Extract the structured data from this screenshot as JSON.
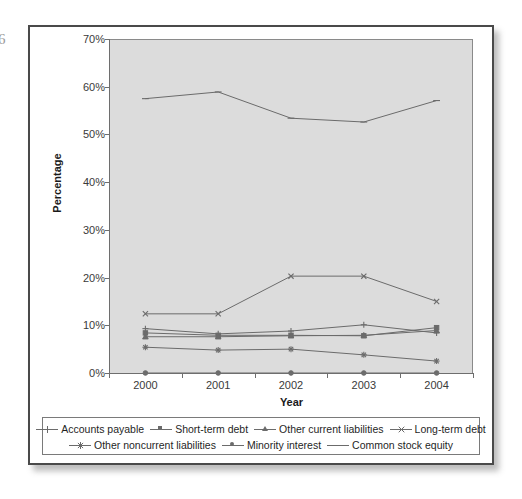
{
  "page": {
    "edge_artifact": "6"
  },
  "chart_data": {
    "type": "line",
    "title": "",
    "xlabel": "Year",
    "ylabel": "Percentage",
    "categories": [
      "2000",
      "2001",
      "2002",
      "2003",
      "2004"
    ],
    "x": [
      2000,
      2001,
      2002,
      2003,
      2004
    ],
    "ylim": [
      0,
      70
    ],
    "y_ticks": [
      "0%",
      "10%",
      "20%",
      "30%",
      "40%",
      "50%",
      "60%",
      "70%"
    ],
    "y_tick_values": [
      0,
      10,
      20,
      30,
      40,
      50,
      60,
      70
    ],
    "grid": false,
    "legend_position": "bottom",
    "plot_background": "#dcdcdc",
    "line_color": "#6b6b6b",
    "series": [
      {
        "name": "Accounts payable",
        "marker": "plus",
        "values": [
          9.3,
          8.2,
          8.8,
          10.1,
          8.4
        ]
      },
      {
        "name": "Short-term debt",
        "marker": "square",
        "values": [
          8.4,
          7.9,
          7.9,
          7.8,
          9.5
        ]
      },
      {
        "name": "Other current liabilities",
        "marker": "triangle",
        "values": [
          7.6,
          7.6,
          7.8,
          7.9,
          8.9
        ]
      },
      {
        "name": "Long-term debt",
        "marker": "cross",
        "values": [
          12.4,
          12.4,
          20.3,
          20.3,
          15.0
        ]
      },
      {
        "name": "Other noncurrent liabilities",
        "marker": "star",
        "values": [
          5.4,
          4.8,
          5.0,
          3.8,
          2.5
        ]
      },
      {
        "name": "Minority interest",
        "marker": "circle",
        "values": [
          0.0,
          0.0,
          0.0,
          0.0,
          0.0
        ]
      },
      {
        "name": "Common stock equity",
        "marker": "dash",
        "values": [
          57.5,
          58.9,
          53.4,
          52.6,
          57.1
        ]
      }
    ]
  }
}
